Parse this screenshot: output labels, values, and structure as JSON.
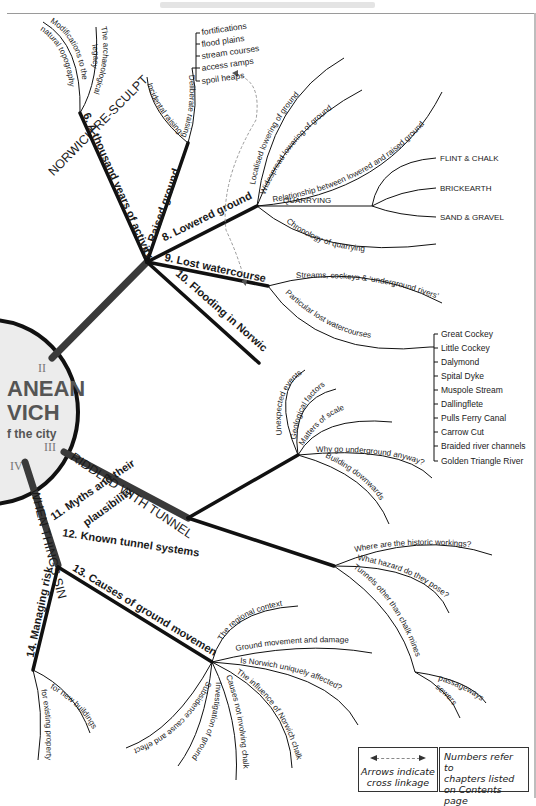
{
  "hub": {
    "line1": "ANEAN",
    "line2": "VICH",
    "line3": "f the city",
    "roman_ii": "II",
    "roman_iii": "III",
    "roman_iv": "IV"
  },
  "sections": {
    "ii": "NORWICH RE-SCULPTED",
    "iii": "RIDDLED WITH TUNNELS?",
    "iv": "WHEN THINGS SINK"
  },
  "chapters": {
    "c6": "6. A thousand years of activity",
    "c7": "7. Raised ground",
    "c8": "8. Lowered ground",
    "c9": "9. Lost watercourses",
    "c10": "10. Flooding in Norwich",
    "c11a": "11. Myths and their",
    "c11b": "plausibility",
    "c12": "12. Known tunnel systems",
    "c13": "13. Causes of ground movement",
    "c14": "14. Managing risk"
  },
  "c6_topics": {
    "mod1": "Modifications to the",
    "mod2": "natural topography",
    "arch1": "The archaeological",
    "arch2": "legacy"
  },
  "c7_topics": {
    "incidental": "Incidental raising",
    "deliberate": "Deliberate raising",
    "items": [
      "fortifications",
      "flood plains",
      "stream courses",
      "access ramps",
      "spoil heaps"
    ]
  },
  "c8_topics": {
    "localised": "Localised lowering of ground",
    "widespread": "Widespread lowering of ground",
    "relationship": "Relationship between lowered and raised ground",
    "quarrying": "QUARRYING",
    "quarry_types": [
      "FLINT & CHALK",
      "BRICKEARTH",
      "SAND & GRAVEL"
    ],
    "chronology": "Chronology of quarrying"
  },
  "c9_topics": {
    "streams": "Streams, cockeys & ‘underground rivers’",
    "particular": "Particular lost watercourses",
    "watercourses": [
      "Great Cockey",
      "Little Cockey",
      "Dalymond",
      "Spital Dyke",
      "Muspole Stream",
      "Dallingflete",
      "Pulls Ferry Canal",
      "Carrow Cut",
      "Braided river channels",
      "Golden Triangle River"
    ]
  },
  "c11_topics": {
    "unexpected": "Unexpected events",
    "geological": "Geological factors",
    "scale": "Matters of scale",
    "why": "Why go underground anyway?",
    "building": "Building downwards"
  },
  "c12_topics": {
    "where": "Where are the historic workings?",
    "hazard": "What hazard do they pose?",
    "other": "Tunnels other than chalk mines",
    "passageways": "passageways",
    "sewers": "sewers"
  },
  "c13_topics": {
    "regional": "The regional context",
    "damage": "Ground movement and damage",
    "unique": "Is Norwich uniquely affected?",
    "influence": "The influence of Norwich chalk",
    "not_chalk": "Causes not involving chalk",
    "investigation": "Investigation of ground",
    "subsidence": "Subsidence cause and effect"
  },
  "c14_topics": {
    "new": "for new buildings",
    "existing": "for existing property"
  },
  "legend": {
    "arrows_line1": "Arrows indicate",
    "arrows_line2": "cross linkage",
    "numbers_line1": "Numbers refer to",
    "numbers_line2": "chapters listed",
    "numbers_line3": "on Contents page"
  },
  "colors": {
    "ink": "#1a1a1a",
    "hub_fill": "#ececec",
    "hub_text": "#555555",
    "section_stroke": "#3a3a3a",
    "crosslink": "#9a9a9a"
  }
}
